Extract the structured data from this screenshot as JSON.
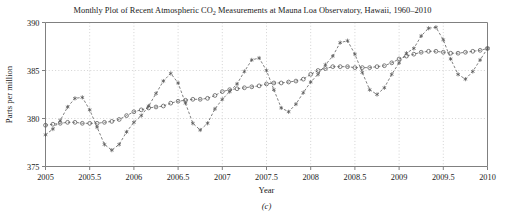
{
  "figure": {
    "caption": "(c)",
    "title_prefix": "Monthly Plot of Recent Atmospheric CO",
    "title_subscript": "2",
    "title_suffix": " Measurements at Mauna Loa Observatory, Hawaii, 1960–2010",
    "title_full": "Monthly Plot of Recent Atmospheric CO2 Measurements at Mauna Loa Observatory, Hawaii, 1960–2010"
  },
  "colors": {
    "axis": "#808080",
    "grid": "#c8c8c8",
    "seasonal_series": "#555555",
    "trend_series": "#555555",
    "text": "#1a1a1a",
    "background": "#ffffff"
  },
  "chart_data": {
    "type": "line",
    "title": "Monthly Plot of Recent Atmospheric CO2 Measurements at Mauna Loa Observatory, Hawaii, 1960–2010",
    "xlabel": "Year",
    "ylabel": "Parts per million",
    "xlim": [
      2005,
      2010
    ],
    "ylim": [
      375,
      390
    ],
    "xticks": [
      2005,
      2005.5,
      2006,
      2006.5,
      2007,
      2007.5,
      2008,
      2008.5,
      2009,
      2009.5,
      2010
    ],
    "xtick_labels": [
      "2005",
      "2005.5",
      "2006",
      "2006.5",
      "2007",
      "2007.5",
      "2008",
      "2008.5",
      "2009",
      "2009.5",
      "2010"
    ],
    "yticks": [
      375,
      380,
      385,
      390
    ],
    "ytick_labels": [
      "375",
      "380",
      "385",
      "390"
    ],
    "grid": true,
    "legend": "none",
    "x": [
      2005.0,
      2005.0833,
      2005.1667,
      2005.25,
      2005.3333,
      2005.4167,
      2005.5,
      2005.5833,
      2005.6667,
      2005.75,
      2005.8333,
      2005.9167,
      2006.0,
      2006.0833,
      2006.1667,
      2006.25,
      2006.3333,
      2006.4167,
      2006.5,
      2006.5833,
      2006.6667,
      2006.75,
      2006.8333,
      2006.9167,
      2007.0,
      2007.0833,
      2007.1667,
      2007.25,
      2007.3333,
      2007.4167,
      2007.5,
      2007.5833,
      2007.6667,
      2007.75,
      2007.8333,
      2007.9167,
      2008.0,
      2008.0833,
      2008.1667,
      2008.25,
      2008.3333,
      2008.4167,
      2008.5,
      2008.5833,
      2008.6667,
      2008.75,
      2008.8333,
      2008.9167,
      2009.0,
      2009.0833,
      2009.1667,
      2009.25,
      2009.3333,
      2009.4167,
      2009.5,
      2009.5833,
      2009.6667,
      2009.75,
      2009.8333,
      2009.9167,
      2010.0
    ],
    "series": [
      {
        "name": "Monthly observed CO2",
        "marker": "asterisk",
        "linestyle": "dashed",
        "values": [
          378.3,
          378.9,
          379.8,
          381.2,
          382.1,
          382.2,
          380.9,
          379.1,
          377.3,
          376.7,
          377.3,
          378.6,
          379.6,
          380.3,
          381.3,
          382.6,
          383.9,
          384.7,
          383.7,
          381.6,
          379.5,
          378.8,
          379.5,
          381.0,
          382.0,
          382.8,
          383.6,
          384.9,
          386.1,
          386.3,
          385.0,
          383.0,
          381.1,
          380.7,
          381.5,
          382.7,
          383.8,
          384.6,
          385.6,
          386.5,
          387.9,
          388.1,
          386.7,
          384.8,
          383.0,
          382.5,
          383.2,
          384.6,
          385.8,
          386.8,
          387.3,
          388.6,
          389.4,
          389.5,
          388.2,
          386.2,
          384.6,
          384.1,
          384.9,
          386.1,
          387.3
        ]
      },
      {
        "name": "Seasonally adjusted trend",
        "marker": "circle",
        "linestyle": "dashed",
        "values": [
          379.3,
          379.4,
          379.5,
          379.6,
          379.6,
          379.5,
          379.5,
          379.5,
          379.6,
          379.7,
          379.9,
          380.3,
          380.7,
          380.9,
          381.1,
          381.2,
          381.3,
          381.6,
          381.8,
          381.9,
          382.0,
          382.0,
          382.1,
          382.4,
          382.8,
          383.0,
          383.1,
          383.2,
          383.3,
          383.4,
          383.6,
          383.7,
          383.7,
          383.8,
          383.9,
          384.1,
          384.6,
          385.0,
          385.2,
          385.4,
          385.4,
          385.4,
          385.3,
          385.3,
          385.3,
          385.4,
          385.5,
          385.8,
          386.2,
          386.5,
          386.7,
          386.9,
          387.0,
          387.0,
          386.9,
          386.8,
          386.8,
          386.9,
          387.0,
          387.1,
          387.3
        ]
      }
    ]
  }
}
